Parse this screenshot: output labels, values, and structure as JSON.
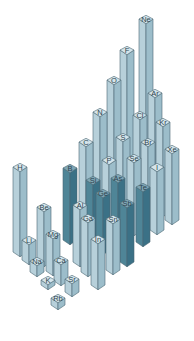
{
  "chart_data": {
    "type": "bar3d",
    "title": "",
    "subtitle": "",
    "quantity": "Electronegativity (3D bar height per element)",
    "xlabel": "",
    "ylabel": "",
    "grid": false,
    "legend": null,
    "iso": {
      "dx": 14.5,
      "dy": 9,
      "bar_width": 12
    },
    "colors": {
      "light_top": "#d4e4ea",
      "light_left": "#b7d0da",
      "light_right": "#9cbdca",
      "dark_top": "#7fa6b5",
      "dark_left": "#4f8597",
      "dark_right": "#3b7186",
      "edge": "#4a6672",
      "label": "#2d4450"
    },
    "elements": [
      {
        "symbol": "Ne",
        "x": 146,
        "y": 19,
        "base": 195,
        "shade": "light"
      },
      {
        "symbol": "F",
        "x": 127,
        "y": 50,
        "base": 205,
        "shade": "light"
      },
      {
        "symbol": "O",
        "x": 114,
        "y": 80,
        "base": 213,
        "shade": "light"
      },
      {
        "symbol": "N",
        "x": 100,
        "y": 112,
        "base": 222,
        "shade": "light"
      },
      {
        "symbol": "C",
        "x": 86,
        "y": 142,
        "base": 231,
        "shade": "light"
      },
      {
        "symbol": "B",
        "x": 70,
        "y": 168,
        "base": 240,
        "shade": "dark"
      },
      {
        "symbol": "Ar",
        "x": 155,
        "y": 93,
        "base": 203,
        "shade": "light"
      },
      {
        "symbol": "Cl",
        "x": 140,
        "y": 115,
        "base": 212,
        "shade": "light"
      },
      {
        "symbol": "S",
        "x": 123,
        "y": 137,
        "base": 222,
        "shade": "light"
      },
      {
        "symbol": "P",
        "x": 109,
        "y": 160,
        "base": 231,
        "shade": "light"
      },
      {
        "symbol": "Si",
        "x": 93,
        "y": 180,
        "base": 241,
        "shade": "dark"
      },
      {
        "symbol": "Kr",
        "x": 163,
        "y": 122,
        "base": 212,
        "shade": "light"
      },
      {
        "symbol": "Br",
        "x": 148,
        "y": 142,
        "base": 221,
        "shade": "light"
      },
      {
        "symbol": "Se",
        "x": 134,
        "y": 158,
        "base": 231,
        "shade": "light"
      },
      {
        "symbol": "As",
        "x": 118,
        "y": 178,
        "base": 241,
        "shade": "dark"
      },
      {
        "symbol": "Ge",
        "x": 103,
        "y": 193,
        "base": 250,
        "shade": "dark"
      },
      {
        "symbol": "Xe",
        "x": 172,
        "y": 149,
        "base": 220,
        "shade": "light"
      },
      {
        "symbol": "I",
        "x": 157,
        "y": 167,
        "base": 230,
        "shade": "light"
      },
      {
        "symbol": "Te",
        "x": 143,
        "y": 187,
        "base": 242,
        "shade": "dark"
      },
      {
        "symbol": "Sb",
        "x": 127,
        "y": 203,
        "base": 262,
        "shade": "dark"
      },
      {
        "symbol": "Sn",
        "x": 113,
        "y": 219,
        "base": 270,
        "shade": "light"
      },
      {
        "symbol": "Al",
        "x": 80,
        "y": 205,
        "base": 262,
        "shade": "light"
      },
      {
        "symbol": "Ga",
        "x": 88,
        "y": 218,
        "base": 272,
        "shade": "light"
      },
      {
        "symbol": "In",
        "x": 98,
        "y": 239,
        "base": 285,
        "shade": "light"
      },
      {
        "symbol": "H",
        "x": 20,
        "y": 167,
        "base": 252,
        "shade": "light"
      },
      {
        "symbol": "Be",
        "x": 44,
        "y": 207,
        "base": 262,
        "shade": "light"
      },
      {
        "symbol": "Li",
        "x": 29,
        "y": 240,
        "base": 260,
        "shade": "light"
      },
      {
        "symbol": "Mg",
        "x": 53,
        "y": 234,
        "base": 271,
        "shade": "light"
      },
      {
        "symbol": "Na",
        "x": 37,
        "y": 261,
        "base": 272,
        "shade": "light"
      },
      {
        "symbol": "Ca",
        "x": 61,
        "y": 260,
        "base": 281,
        "shade": "light"
      },
      {
        "symbol": "K",
        "x": 48,
        "y": 280,
        "base": 285,
        "shade": "light"
      },
      {
        "symbol": "Sr",
        "x": 72,
        "y": 279,
        "base": 292,
        "shade": "light"
      },
      {
        "symbol": "Rb",
        "x": 58,
        "y": 298,
        "base": 305,
        "shade": "light"
      }
    ]
  }
}
